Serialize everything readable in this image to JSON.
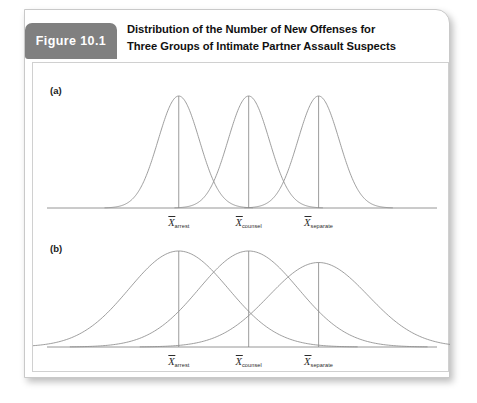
{
  "figure": {
    "tag_label": "Figure 10.1",
    "title_line1": "Distribution of the Number of New Offenses for",
    "title_line2": "Three Groups of Intimate Partner Assault Suspects",
    "tag_bg_color": "#808080",
    "tag_text_color": "#ffffff",
    "curve_color": "#8c8c8c",
    "axis_color": "#8a8a8a",
    "card_bg_color": "#ffffff"
  },
  "panels": [
    {
      "id": "a",
      "label": "(a)"
    },
    {
      "id": "b",
      "label": "(b)"
    }
  ],
  "mean_labels": {
    "symbol": "X",
    "arrest": "arrest",
    "counsel": "counsel",
    "separate": "separate"
  },
  "chart_data": {
    "type": "line",
    "title": "Distribution of the Number of New Offenses for Three Groups of Intimate Partner Assault Suspects",
    "xlabel": "",
    "ylabel": "",
    "grid": false,
    "legend": "none",
    "axis_ticks_shown": false,
    "panels": [
      {
        "panel": "(a)",
        "description": "Three narrow, well-separated normal distributions with little overlap",
        "xlim": [
          0,
          100
        ],
        "ylim": [
          0,
          1
        ],
        "curves": [
          {
            "name": "arrest",
            "mean": 32,
            "sd": 5.6,
            "peak_height": 1.0
          },
          {
            "name": "counsel",
            "mean": 51,
            "sd": 5.6,
            "peak_height": 1.0
          },
          {
            "name": "separate",
            "mean": 70,
            "sd": 5.6,
            "peak_height": 1.0
          }
        ],
        "mean_markers": [
          {
            "label": "arrest",
            "x": 32
          },
          {
            "label": "counsel",
            "x": 51
          },
          {
            "label": "separate",
            "x": 70
          }
        ]
      },
      {
        "panel": "(b)",
        "description": "Three wide, flat normal distributions with substantial overlap at the same three means",
        "xlim": [
          0,
          100
        ],
        "ylim": [
          0,
          1
        ],
        "curves": [
          {
            "name": "arrest",
            "mean": 32,
            "sd": 13.5,
            "peak_height": 1.0
          },
          {
            "name": "counsel",
            "mean": 51,
            "sd": 13.5,
            "peak_height": 1.0
          },
          {
            "name": "separate",
            "mean": 70,
            "sd": 13.5,
            "peak_height": 0.88
          }
        ],
        "mean_markers": [
          {
            "label": "arrest",
            "x": 32
          },
          {
            "label": "counsel",
            "x": 51
          },
          {
            "label": "separate",
            "x": 70
          }
        ]
      }
    ]
  }
}
